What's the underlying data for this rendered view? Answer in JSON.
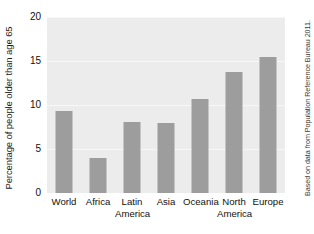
{
  "chart_data": {
    "type": "bar",
    "title": "",
    "subtitle": "",
    "xlabel": "",
    "ylabel": "Percentage of people older than age 65",
    "categories": [
      "World",
      "Africa",
      "Latin America",
      "Asia",
      "Oceania",
      "North America",
      "Europe"
    ],
    "category_lines": [
      [
        "World",
        ""
      ],
      [
        "Africa",
        ""
      ],
      [
        "Latin",
        "America"
      ],
      [
        "Asia",
        ""
      ],
      [
        "Oceania",
        ""
      ],
      [
        "North",
        "America"
      ],
      [
        "Europe",
        ""
      ]
    ],
    "values": [
      9.3,
      4.0,
      8.1,
      8.0,
      10.7,
      13.7,
      15.5
    ],
    "ylim": [
      0,
      20
    ],
    "yticks": [
      0,
      5,
      10,
      15,
      20
    ],
    "ytick_labels": [
      "0",
      "5",
      "10",
      "15",
      "20"
    ],
    "grid": true,
    "grid_axis": "y",
    "legend": false,
    "legend_position": "none",
    "bar_color": "#9d9d9d",
    "plot_background": "#ececec",
    "gridline_color": "#f7f7f7",
    "figure_background": "#ffffff"
  },
  "annotations": {
    "source_note": "Based on data from Population Reference Bureau 2011."
  }
}
